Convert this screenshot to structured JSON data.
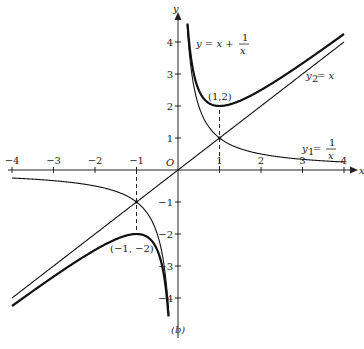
{
  "chart_data": {
    "type": "line",
    "title": "",
    "caption": "(b)",
    "xlabel": "x",
    "ylabel": "y",
    "origin_label": "O",
    "xlim": [
      -4,
      4
    ],
    "ylim": [
      -4.5,
      4.5
    ],
    "x_ticks": [
      -4,
      -3,
      -2,
      -1,
      1,
      2,
      3,
      4
    ],
    "x_tick_labels": [
      "−4",
      "−3",
      "−2",
      "−1",
      "1",
      "2",
      "3",
      "4"
    ],
    "y_ticks": [
      -4,
      -3,
      -2,
      -1,
      1,
      2,
      3,
      4
    ],
    "y_tick_labels": [
      "−4",
      "−3",
      "−2",
      "−1",
      "1",
      "2",
      "3",
      "4"
    ],
    "grid": false,
    "series": [
      {
        "name": "y = x + 1/x",
        "style": "thick",
        "expression": "x + 1/x",
        "domain": [
          [
            -4,
            -0.23
          ],
          [
            0.23,
            4
          ]
        ]
      },
      {
        "name": "y2 = x",
        "style": "thin",
        "expression": "x",
        "domain": [
          [
            -4,
            4
          ]
        ]
      },
      {
        "name": "y1 = 1/x",
        "style": "thin",
        "expression": "1/x",
        "domain": [
          [
            -4,
            -0.22
          ],
          [
            0.22,
            4
          ]
        ]
      }
    ],
    "annotations": [
      {
        "text": "(1,2)",
        "x": 1,
        "y": 2,
        "type": "local minimum"
      },
      {
        "text": "(−1, −2)",
        "x": -1,
        "y": -2,
        "type": "local maximum"
      }
    ],
    "dashed_guides": [
      {
        "x": 1,
        "from_y": 0,
        "to_y": 2
      },
      {
        "x": -1,
        "from_y": 0,
        "to_y": -2
      }
    ],
    "labels": {
      "sum_curve": {
        "lhs": "y = x + ",
        "num": "1",
        "den": "x"
      },
      "line": {
        "base": "y",
        "sub": "2",
        "rhs": " = x"
      },
      "hyperbola": {
        "base": "y",
        "sub": "1",
        "eq": " = ",
        "num": "1",
        "den": "x"
      }
    }
  }
}
